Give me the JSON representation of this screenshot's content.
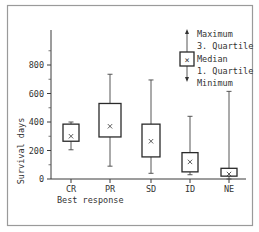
{
  "chart_data": {
    "type": "boxplot",
    "title": "",
    "xlabel": "Best response",
    "ylabel": "Survival days",
    "ylim": [
      0,
      1000
    ],
    "yticks": [
      0,
      200,
      400,
      600,
      800
    ],
    "ytick_labels": [
      "0",
      "200",
      "400",
      "600",
      "800"
    ],
    "minor_yticks": [
      100,
      300,
      500,
      700,
      900
    ],
    "grid": false,
    "categories": [
      "CR",
      "PR",
      "SD",
      "ID",
      "NE"
    ],
    "series": [
      {
        "category": "CR",
        "min": 205,
        "q1": 265,
        "median": 300,
        "q3": 385,
        "max": 400
      },
      {
        "category": "PR",
        "min": 90,
        "q1": 295,
        "median": 370,
        "q3": 530,
        "max": 735
      },
      {
        "category": "SD",
        "min": 40,
        "q1": 155,
        "median": 265,
        "q3": 385,
        "max": 695
      },
      {
        "category": "ID",
        "min": 30,
        "q1": 50,
        "median": 120,
        "q3": 185,
        "max": 440
      },
      {
        "category": "NE",
        "min": 0,
        "q1": 20,
        "median": 35,
        "q3": 75,
        "max": 615
      }
    ],
    "legend": {
      "position": "top-right",
      "entries": [
        "Maximum",
        "3. Quartile",
        "Median",
        "1. Quartile",
        "Minimum"
      ],
      "median_marker": "×"
    }
  },
  "colors": {
    "frame": "#9a9a9a",
    "ink": "#333333",
    "background": "#ffffff"
  }
}
